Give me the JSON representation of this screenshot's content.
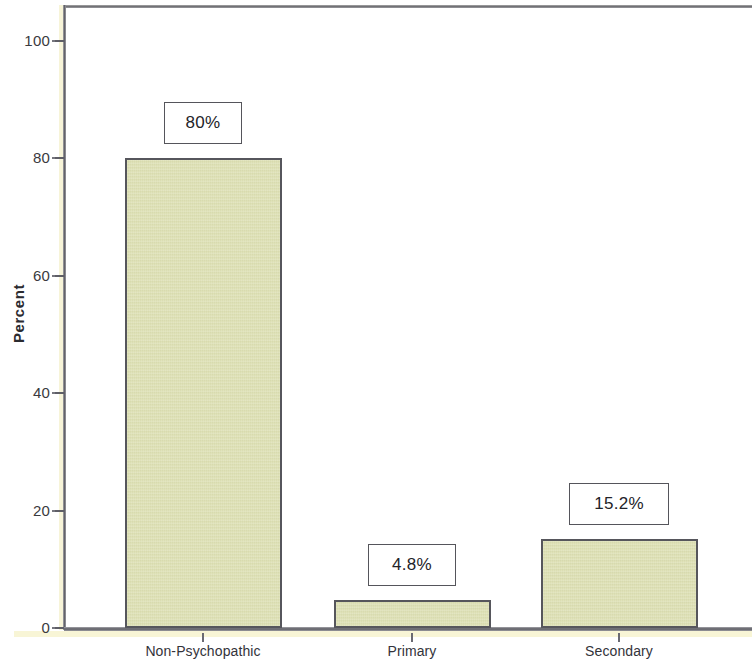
{
  "chart_data": {
    "type": "bar",
    "title": "",
    "subtitle": "",
    "xlabel": "",
    "ylabel": "Percent",
    "categories": [
      "Non-Psychopathic",
      "Primary",
      "Secondary"
    ],
    "values": [
      80,
      4.8,
      15.2
    ],
    "data_labels": [
      "80%",
      "4.8%",
      "15.2%"
    ],
    "ylim": [
      0,
      105
    ],
    "yticks": [
      0,
      20,
      40,
      60,
      80,
      100
    ],
    "ytick_labels": [
      "0",
      "20",
      "40",
      "60",
      "80",
      "100"
    ],
    "grid": false,
    "legend": null,
    "series": [
      {
        "name": "Percent",
        "values": [
          80,
          4.8,
          15.2
        ]
      }
    ],
    "colors": {
      "bar_fill": "#dcdfb0",
      "bar_border": "#56565c",
      "axis": "#5d5d64",
      "axis_highlight": "#f8f5d6",
      "label_box_fill": "#ffffff",
      "label_box_border": "#55555b",
      "text": "#2b2b30",
      "background": "#ffffff"
    }
  }
}
